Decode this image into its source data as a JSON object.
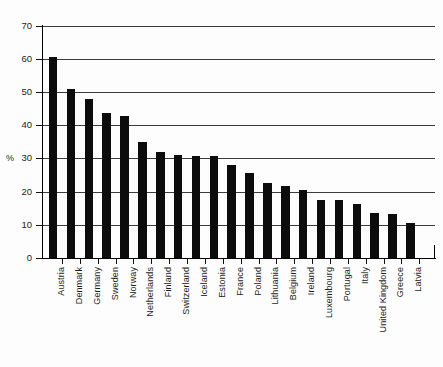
{
  "chart_data": {
    "type": "bar",
    "title": "",
    "subtitle": "",
    "xlabel": "",
    "ylabel": "%",
    "ylim": [
      0,
      70
    ],
    "ytick_step": 10,
    "yticks": [
      0,
      10,
      20,
      30,
      40,
      50,
      60,
      70
    ],
    "ytick_labels": [
      "0",
      "10",
      "20",
      "30",
      "40",
      "50",
      "60",
      "70"
    ],
    "grid": true,
    "grid_axis": "y",
    "legend": false,
    "legend_position": "none",
    "orientation": "vertical",
    "bar_color": "#0c0c0c",
    "categories": [
      "Austria",
      "Denmark",
      "Germany",
      "Sweden",
      "Norway",
      "Netherlands",
      "Finland",
      "Switzerland",
      "Iceland",
      "Estonia",
      "France",
      "Poland",
      "Lithuania",
      "Belgium",
      "Ireland",
      "Luxembourg",
      "Portugal",
      "Italy",
      "United Kingdom",
      "Greece",
      "Latvia"
    ],
    "values": [
      60.6,
      50.9,
      48.0,
      43.8,
      42.8,
      34.8,
      31.8,
      30.9,
      30.8,
      30.8,
      27.9,
      25.7,
      22.7,
      21.6,
      20.6,
      17.5,
      17.5,
      16.4,
      13.4,
      13.3,
      10.4
    ],
    "value_labels": false,
    "xtick_label_rotation": -90
  },
  "figure": {
    "background_color": "#ffffff",
    "axis_color": "#000000",
    "gridline_color": "#3c3c3c"
  }
}
